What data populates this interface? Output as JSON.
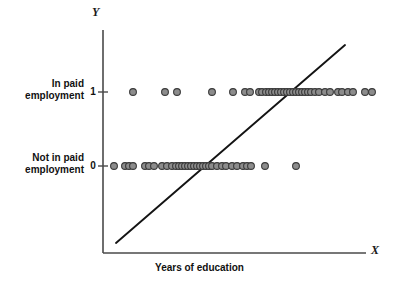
{
  "figure": {
    "background_color": "#ffffff"
  },
  "axes": {
    "y_axis_title": "Y",
    "x_axis_title": "X",
    "y_tick_labels": [
      "1",
      "0"
    ],
    "y_category_labels": [
      "In paid\nemployment",
      "Not in paid\nemployment"
    ],
    "y_category_label_top_line1": "In paid",
    "y_category_label_top_line2": "employment",
    "y_category_label_bottom_line1": "Not in paid",
    "y_category_label_bottom_line2": "employment"
  },
  "caption": "Years of education",
  "colors": {
    "axis": "#4a4a4a",
    "line": "#141414",
    "marker_fill": "#8c8c8c",
    "marker_stroke": "#3a3a3a",
    "text": "#111111"
  },
  "chart_data": {
    "type": "scatter",
    "title": "",
    "subtitle": "",
    "xlabel": "Years of education",
    "ylabel": "Y",
    "x_axis_symbol": "X",
    "y_axis_symbol": "Y",
    "grid": false,
    "legend": "none",
    "ytick_values": [
      0,
      1
    ],
    "ytick_labels": [
      "0",
      "1"
    ],
    "ycategory_labels": [
      "Not in paid employment",
      "In paid employment"
    ],
    "ylim": [
      -0.35,
      1.45
    ],
    "xlim": [
      0,
      20
    ],
    "xticks_shown": false,
    "marker": "open-circle-gray",
    "series": [
      {
        "name": "In paid employment (Y=1)",
        "y_value": 1,
        "x_values": [
          5.05,
          7.75,
          8.75,
          11.75,
          13.5,
          14.55,
          14.95,
          15.7,
          15.95,
          16.35,
          16.6,
          16.85,
          17.1,
          17.35,
          17.6,
          17.85,
          18.1,
          18.35,
          18.6,
          18.85,
          19.1,
          19.35,
          19.6,
          19.85,
          20.1,
          20.45,
          20.75,
          21.3,
          21.7,
          22.35,
          22.75,
          23.3,
          23.7,
          24.75,
          25.35
        ]
      },
      {
        "name": "Not in paid employment (Y=0)",
        "y_value": 0,
        "x_values": [
          3.45,
          4.35,
          4.75,
          5.05,
          6.05,
          6.45,
          6.85,
          7.55,
          7.95,
          8.35,
          8.7,
          8.95,
          9.2,
          9.45,
          9.7,
          9.95,
          10.2,
          10.45,
          10.7,
          10.95,
          11.2,
          11.45,
          11.75,
          12.15,
          12.55,
          12.95,
          13.45,
          13.85,
          14.45,
          14.75,
          15.05,
          16.25,
          18.85
        ]
      }
    ],
    "regression_line": {
      "label": "OLS fitted line",
      "x_start": 4.7,
      "y_start": -0.27,
      "x_end": 25.3,
      "y_end": 1.42
    }
  },
  "geometry": {
    "axis_x_px": 103,
    "axis_y_px": 253,
    "y1_px": 92,
    "y0_px": 166,
    "y_axis_top_px": 30,
    "x_axis_right_px": 366,
    "x_plot_left_px": 103,
    "x_per_unit_px": 11.8,
    "x_origin_px": 103,
    "line_start_px": [
      116,
      243
    ],
    "line_end_px": [
      345,
      45
    ],
    "marker_radius_px": 3.4
  },
  "markers_px": {
    "row_y1": [
      133,
      165,
      177,
      212,
      233,
      245,
      250,
      259,
      262,
      266,
      269,
      272,
      275,
      278,
      281,
      284,
      287,
      290,
      293,
      296,
      299,
      302,
      305,
      308,
      311,
      315,
      319,
      325,
      330,
      338,
      342,
      348,
      353,
      365,
      372
    ],
    "row_y0": [
      114,
      125,
      129,
      133,
      145,
      149,
      154,
      162,
      167,
      172,
      176,
      179,
      182,
      185,
      188,
      191,
      194,
      197,
      200,
      203,
      206,
      209,
      212,
      217,
      222,
      226,
      232,
      237,
      243,
      247,
      251,
      265,
      296
    ]
  }
}
